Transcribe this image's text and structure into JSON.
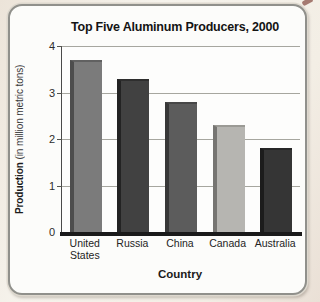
{
  "page": {
    "background": "#f3eee5",
    "corner_smudge_color": "#96655c"
  },
  "frame": {
    "background": "#fcfcfa",
    "border_color": "#90908b"
  },
  "chart_data": {
    "type": "bar",
    "title": "Top Five Aluminum Producers, 2000",
    "xlabel": "Country",
    "ylabel": "Production (in million metric tons)",
    "ylabel_bold_part": "Production",
    "ylabel_regular_part": " (in million metric tons)",
    "categories": [
      "United States",
      "Russia",
      "China",
      "Canada",
      "Australia"
    ],
    "values": [
      3.7,
      3.3,
      2.8,
      2.3,
      1.8
    ],
    "ylim": [
      0,
      4
    ],
    "yticks": [
      4,
      3,
      2,
      1,
      0
    ],
    "grid": true,
    "legend": false,
    "axis_color": "#4a4a4a",
    "gridline_color": "#a6a69f",
    "baseline_color": "#1a1a1a",
    "bar_fill_colors": [
      "#7b7b7b",
      "#414141",
      "#5c5c5c",
      "#b6b5b1",
      "#353535"
    ],
    "bar_edge_colors": [
      "#4d4d4d",
      "#232323",
      "#383838",
      "#767572",
      "#1c1c1c"
    ],
    "bar_top_colors": [
      "#616161",
      "#2e2e2e",
      "#474747",
      "#9b9a95",
      "#272727"
    ]
  }
}
